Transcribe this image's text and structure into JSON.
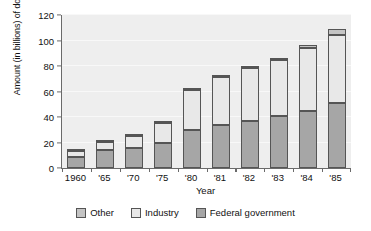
{
  "chart_data": {
    "type": "bar",
    "stacked": true,
    "title": "",
    "xlabel": "Year",
    "ylabel": "Amount (in billions) of dollars",
    "categories": [
      "1960",
      "'65",
      "'70",
      "'75",
      "'80",
      "'81",
      "'82",
      "'83",
      "'84",
      "'85"
    ],
    "ylim": [
      0,
      120
    ],
    "yticks": [
      0,
      20,
      40,
      60,
      80,
      100,
      120
    ],
    "grid": true,
    "legend_position": "bottom",
    "series": [
      {
        "name": "Federal government",
        "color": "#a6a6a6",
        "values": [
          9,
          14,
          16,
          20,
          30,
          33.5,
          37,
          41,
          45,
          51
        ]
      },
      {
        "name": "Industry",
        "color": "#e8e8e8",
        "values": [
          4,
          6.5,
          9,
          15.5,
          31,
          37.5,
          41.5,
          43.5,
          49.5,
          53
        ]
      },
      {
        "name": "Other",
        "color": "#c4c4c4",
        "values": [
          0.5,
          0.8,
          1.2,
          0.8,
          2,
          1,
          1.3,
          1.8,
          2.2,
          5
        ]
      }
    ],
    "totals": [
      13.5,
      21.3,
      26.2,
      36.3,
      63,
      72,
      79.8,
      86.3,
      96.7,
      109
    ]
  },
  "legend": {
    "items": [
      {
        "label": "Other",
        "swatch": "other-swatch"
      },
      {
        "label": "Industry",
        "swatch": "industry-swatch"
      },
      {
        "label": "Federal government",
        "swatch": "federal-government-swatch"
      }
    ]
  }
}
